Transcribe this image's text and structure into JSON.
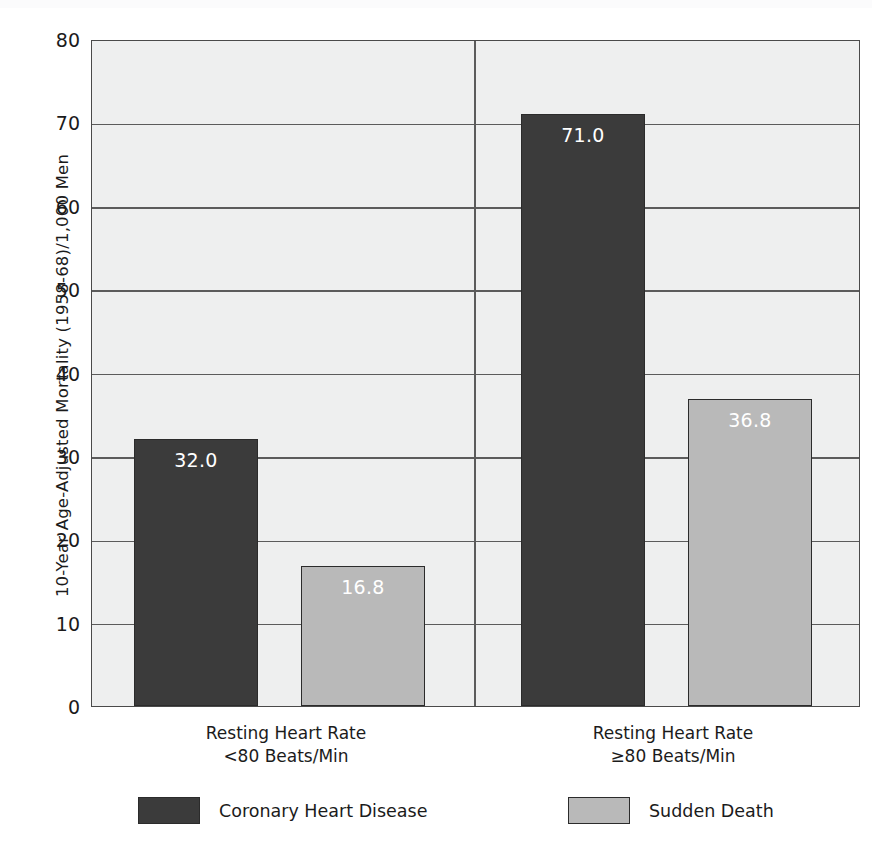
{
  "chart_data": {
    "type": "bar",
    "title": "",
    "subtitle": "",
    "xlabel": "",
    "ylabel": "10-Year Age-Adjusted Mortality (1958-68)/1,000 Men",
    "ylim": [
      0,
      80
    ],
    "yticks": [
      0,
      10,
      20,
      30,
      40,
      50,
      60,
      70,
      80
    ],
    "ytick_labels": [
      "0",
      "10",
      "20",
      "30",
      "40",
      "50",
      "60",
      "70",
      "80"
    ],
    "grid": "horizontal",
    "legend_position": "bottom",
    "categories": [
      "Resting Heart Rate <80 Beats/Min",
      "Resting Heart Rate ≥80 Beats/Min"
    ],
    "category_labels": [
      {
        "line1": "Resting Heart Rate",
        "line2": "<80 Beats/Min"
      },
      {
        "line1": "Resting Heart Rate",
        "line2": "≥80 Beats/Min"
      }
    ],
    "series": [
      {
        "name": "Coronary Heart Disease",
        "color": "#3b3b3b",
        "values": [
          32.0,
          71.0
        ],
        "value_labels": [
          "32.0",
          "71.0"
        ]
      },
      {
        "name": "Sudden Death",
        "color": "#b9b9b9",
        "values": [
          16.8,
          36.8
        ],
        "value_labels": [
          "16.8",
          "36.8"
        ]
      }
    ],
    "bars": [
      {
        "group": 0,
        "series": "Coronary Heart Disease",
        "value": 32.0,
        "label": "32.0",
        "style": "dark"
      },
      {
        "group": 0,
        "series": "Sudden Death",
        "value": 16.8,
        "label": "16.8",
        "style": "light"
      },
      {
        "group": 1,
        "series": "Coronary Heart Disease",
        "value": 71.0,
        "label": "71.0",
        "style": "dark"
      },
      {
        "group": 1,
        "series": "Sudden Death",
        "value": 36.8,
        "label": "36.8",
        "style": "light"
      }
    ],
    "legend": [
      {
        "label": "Coronary Heart Disease",
        "style": "dark",
        "color": "#3b3b3b"
      },
      {
        "label": "Sudden Death",
        "style": "light",
        "color": "#b9b9b9"
      }
    ],
    "colors": {
      "plot_background": "#eeefef",
      "page_background": "#ffffff",
      "axis": "#4a4a4a",
      "gridline": "#5b5b5b",
      "text": "#1b1b1b",
      "value_label": "#ffffff",
      "coronary_heart_disease": "#3b3b3b",
      "sudden_death": "#b9b9b9"
    }
  }
}
